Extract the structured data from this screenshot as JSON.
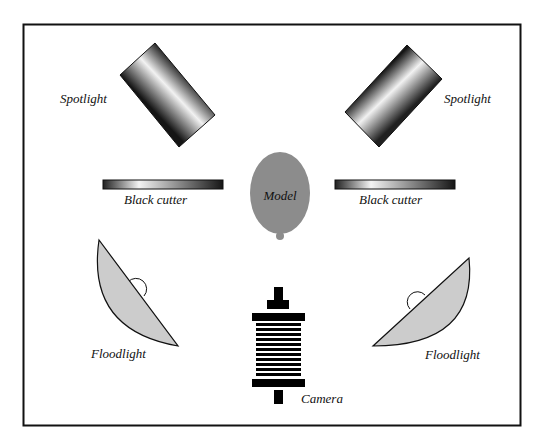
{
  "diagram": {
    "frame": {
      "x": 23,
      "y": 24,
      "width": 498,
      "height": 402,
      "stroke": "#111111"
    },
    "labels": {
      "spotlight_left": "Spotlight",
      "spotlight_right": "Spotlight",
      "cutter_left": "Black cutter",
      "cutter_right": "Black cutter",
      "model": "Model",
      "floodlight_left": "Floodlight",
      "floodlight_right": "Floodlight",
      "camera": "Camera"
    },
    "colors": {
      "model_fill": "#8c8c8c",
      "floodlight_fill": "#cccccc",
      "stroke": "#111111",
      "gradient_dark": "#1a1a1a",
      "gradient_light": "#f4f4f4"
    },
    "elements": [
      {
        "id": "spotlight-left",
        "type": "spotlight",
        "position": "upper-left"
      },
      {
        "id": "spotlight-right",
        "type": "spotlight",
        "position": "upper-right"
      },
      {
        "id": "cutter-left",
        "type": "black-cutter",
        "position": "middle-left"
      },
      {
        "id": "cutter-right",
        "type": "black-cutter",
        "position": "middle-right"
      },
      {
        "id": "model",
        "type": "subject",
        "position": "center"
      },
      {
        "id": "floodlight-left",
        "type": "floodlight",
        "position": "lower-left"
      },
      {
        "id": "floodlight-right",
        "type": "floodlight",
        "position": "lower-right"
      },
      {
        "id": "camera",
        "type": "camera",
        "position": "bottom-center"
      }
    ]
  }
}
